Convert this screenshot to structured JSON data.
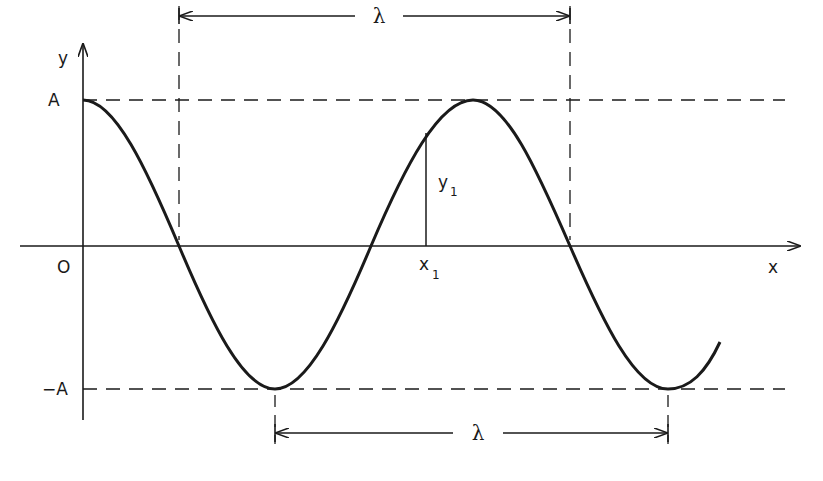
{
  "diagram": {
    "title": "",
    "type": "sinusoidal wave with wavelength annotation",
    "axes": {
      "y_label": "y",
      "x_label": "x",
      "origin_label": "O",
      "amplitude_pos_label": "A",
      "amplitude_neg_label": "−A"
    },
    "annotations": {
      "wavelength_top": "λ",
      "wavelength_bottom": "λ",
      "point_x": "x",
      "point_x_sub": "1",
      "point_y": "y",
      "point_y_sub": "1"
    },
    "colors": {
      "ink": "#1a1a1a",
      "background": "#ffffff"
    }
  }
}
